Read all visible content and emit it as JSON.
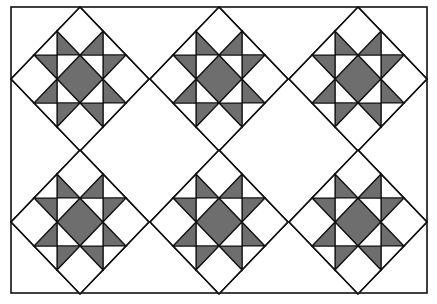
{
  "figure": {
    "type": "quilt-layout",
    "pattern": "Ohio Star blocks set on point",
    "width": 437,
    "height": 304,
    "background": "#ffffff",
    "line_color": "#111111",
    "shade_color": "#6e6e6e",
    "border": {
      "x": 11,
      "y": 7,
      "width": 416,
      "height": 286
    },
    "grid": {
      "rows": 2,
      "cols": 3
    },
    "block_half_width": 69,
    "block_half_height": 72,
    "blocks": [
      {
        "row": 0,
        "col": 0,
        "cx": 80,
        "cy": 79
      },
      {
        "row": 0,
        "col": 1,
        "cx": 219,
        "cy": 79
      },
      {
        "row": 0,
        "col": 2,
        "cx": 358,
        "cy": 79
      },
      {
        "row": 1,
        "col": 0,
        "cx": 80,
        "cy": 222
      },
      {
        "row": 1,
        "col": 1,
        "cx": 219,
        "cy": 222
      },
      {
        "row": 1,
        "col": 2,
        "cx": 358,
        "cy": 222
      }
    ]
  }
}
